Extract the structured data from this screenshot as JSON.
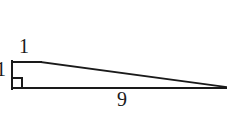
{
  "figure": {
    "background_color": "#ffffff",
    "stroke_color": "#1a1a1a",
    "stroke_width": 2,
    "labels": {
      "vertical_leg": "1",
      "top_edge": "1",
      "base": "9"
    },
    "right_angle_marker": "right-angle-square",
    "geometry": {
      "top_left": [
        12,
        62
      ],
      "bottom_left": [
        12,
        88
      ],
      "apex_right": [
        226,
        87
      ],
      "top_shoulder": [
        40,
        62
      ],
      "marker_size": 10
    }
  }
}
